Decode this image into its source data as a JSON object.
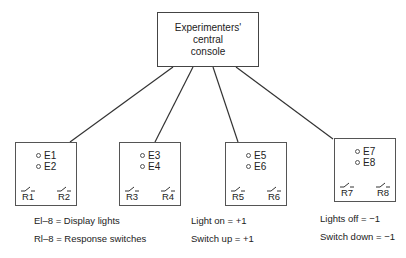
{
  "console": {
    "lines": [
      "Experimenters'",
      "central",
      "console"
    ]
  },
  "stations": [
    {
      "lights": [
        "E1",
        "E2"
      ],
      "switches": [
        "R1",
        "R2"
      ]
    },
    {
      "lights": [
        "E3",
        "E4"
      ],
      "switches": [
        "R3",
        "R4"
      ]
    },
    {
      "lights": [
        "E5",
        "E6"
      ],
      "switches": [
        "R5",
        "R6"
      ]
    },
    {
      "lights": [
        "E7",
        "E8"
      ],
      "switches": [
        "R7",
        "R8"
      ]
    }
  ],
  "legend": {
    "col1": [
      "El–8 = Display lights",
      "Rl–8 = Response switches"
    ],
    "col2": [
      "Light on = +1",
      "Switch up = +1"
    ],
    "col3": [
      "Lights off = −1",
      "Switch down = −1"
    ]
  }
}
